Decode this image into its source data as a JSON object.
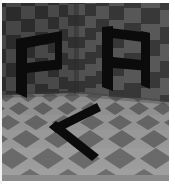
{
  "scene": {
    "title": "3D perspective room corner with checkerboard surfaces",
    "description": "A rendered interior corner showing two walls and a floor tiled with a checkerboard pattern, with three dark extruded glyphs placed on the surfaces.",
    "render_style": "perspective-3d-checkerboard",
    "frame": {
      "matte_color": "#ffffff",
      "bottom_strip_color": "#8a8a8a"
    },
    "vanishing_corner": {
      "x": 78,
      "y": 90
    },
    "surfaces": [
      {
        "id": "left-wall",
        "name": "left-wall",
        "label": "Left wall",
        "tile_light": "#4a4a4a",
        "tile_dark": "#2c2c2c",
        "tiles_u": 8,
        "tiles_v": 8
      },
      {
        "id": "right-wall",
        "name": "right-wall",
        "label": "Right wall",
        "tile_light": "#565656",
        "tile_dark": "#343434",
        "tiles_u": 8,
        "tiles_v": 8
      },
      {
        "id": "floor",
        "name": "floor",
        "label": "Floor",
        "tile_light": "#9b9b9b",
        "tile_dark": "#6a6a6a",
        "tiles_u": 9,
        "tiles_v": 9
      }
    ],
    "glyphs": [
      {
        "id": "glyph-p",
        "character": "P",
        "surface": "left-wall",
        "color": "#0b0b0b",
        "bbox": {
          "x": 15,
          "y": 35,
          "width": 48,
          "height": 62
        }
      },
      {
        "id": "glyph-a",
        "character": "A",
        "surface": "right-wall",
        "color": "#0b0b0b",
        "bbox": {
          "x": 100,
          "y": 22,
          "width": 50,
          "height": 66
        }
      },
      {
        "id": "glyph-l",
        "character": "L",
        "surface": "floor",
        "color": "#0b0b0b",
        "bbox": {
          "x": 48,
          "y": 100,
          "width": 52,
          "height": 56
        }
      }
    ],
    "glyph_sequence": "PAL",
    "palette": {
      "glyph": "#0b0b0b",
      "floor_light": "#9b9b9b",
      "floor_dark": "#6a6a6a",
      "left_wall_light": "#4a4a4a",
      "left_wall_dark": "#2c2c2c",
      "right_wall_light": "#565656",
      "right_wall_dark": "#343434",
      "background": "#ffffff"
    }
  }
}
